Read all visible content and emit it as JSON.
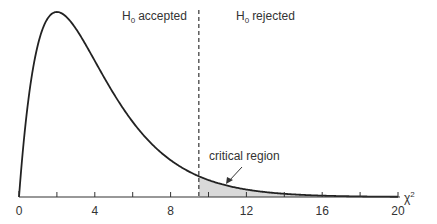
{
  "chart_data": {
    "type": "line",
    "title": "",
    "distribution": "chi-square",
    "degrees_of_freedom": 4,
    "critical_value": 9.49,
    "xlabel": "χ²",
    "ylabel": "",
    "xlim": [
      0,
      20
    ],
    "x_ticks": [
      0,
      2,
      4,
      6,
      8,
      10,
      12,
      14,
      16,
      18,
      20
    ],
    "x_tick_labels": [
      "0",
      "4",
      "8",
      "12",
      "16",
      "20"
    ],
    "x_tick_label_values": [
      0,
      4,
      8,
      12,
      16,
      20
    ],
    "grid": false,
    "series": [
      {
        "name": "chi-square pdf (df=4)",
        "x": [
          0,
          1,
          2,
          3,
          4,
          5,
          6,
          7,
          8,
          9,
          10,
          11,
          12,
          13,
          14,
          15,
          16,
          17,
          18,
          19,
          20
        ],
        "values": [
          0,
          0.152,
          0.184,
          0.167,
          0.135,
          0.103,
          0.075,
          0.053,
          0.037,
          0.025,
          0.017,
          0.011,
          0.007,
          0.005,
          0.003,
          0.002,
          0.001,
          0.001,
          0.001,
          0,
          0
        ]
      }
    ],
    "annotations": {
      "accepted_region_label": "accepted",
      "rejected_region_label": "rejected",
      "hypothesis_symbol": "H",
      "hypothesis_subscript": "0",
      "critical_region_label": "critical region",
      "axis_symbol": "χ",
      "axis_superscript": "2"
    }
  },
  "colors": {
    "curve": "#222222",
    "axis": "#333333",
    "shade": "#d9d9d9",
    "text": "#333333"
  }
}
